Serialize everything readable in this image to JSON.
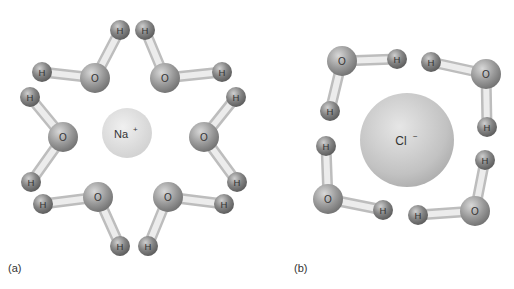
{
  "panels": [
    {
      "id": "a",
      "caption": "(a)",
      "ion": {
        "symbol": "Na",
        "charge": "+",
        "cx": 127,
        "cy": 133,
        "r": 25
      },
      "waters": [
        {
          "o": [
            95,
            78
          ],
          "h": [
            [
              42,
              72
            ],
            [
              120,
              30
            ]
          ]
        },
        {
          "o": [
            165,
            78
          ],
          "h": [
            [
              145,
              30
            ],
            [
              222,
              72
            ]
          ]
        },
        {
          "o": [
            63,
            137
          ],
          "h": [
            [
              30,
              97
            ],
            [
              31,
              182
            ]
          ]
        },
        {
          "o": [
            204,
            137
          ],
          "h": [
            [
              236,
              97
            ],
            [
              237,
              182
            ]
          ]
        },
        {
          "o": [
            98,
            197
          ],
          "h": [
            [
              43,
              204
            ],
            [
              120,
              246
            ]
          ]
        },
        {
          "o": [
            168,
            197
          ],
          "h": [
            [
              224,
              204
            ],
            [
              148,
              246
            ]
          ]
        }
      ]
    },
    {
      "id": "b",
      "caption": "(b)",
      "ion": {
        "symbol": "Cl",
        "charge": "−",
        "cx": 407,
        "cy": 140,
        "r": 47
      },
      "waters": [
        {
          "o": [
            342,
            61
          ],
          "h": [
            [
              397,
              59
            ],
            [
              330,
              111
            ]
          ]
        },
        {
          "o": [
            486,
            74
          ],
          "h": [
            [
              431,
              62
            ],
            [
              487,
              127
            ]
          ]
        },
        {
          "o": [
            328,
            199
          ],
          "h": [
            [
              326,
              146
            ],
            [
              383,
              210
            ]
          ]
        },
        {
          "o": [
            475,
            211
          ],
          "h": [
            [
              485,
              160
            ],
            [
              418,
              215
            ]
          ]
        }
      ]
    }
  ],
  "labels": {
    "oxygen": "O",
    "hydrogen": "H"
  },
  "colors": {
    "oxygen": "#8a8a8a",
    "hydrogen": "#707070",
    "bond": "#dcdcdc",
    "na": "#d9d9d9",
    "cl": "#c4c4c4"
  }
}
